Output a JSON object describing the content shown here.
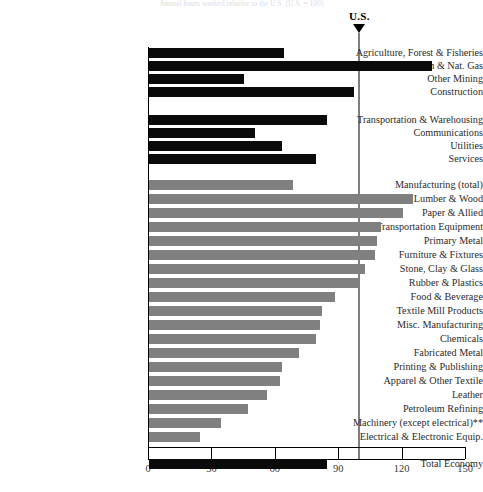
{
  "figure": {
    "title": "Annual hours worked relative to the U.S. (U.S. = 100)",
    "us_marker_label": "U.S.",
    "us_marker_value": 100
  },
  "chart_data": {
    "type": "bar",
    "orientation": "horizontal",
    "title": "Annual hours worked relative to the U.S. (U.S. = 100)",
    "xlabel": "",
    "ylabel": "",
    "xlim": [
      0,
      150
    ],
    "xticks": [
      0,
      30,
      60,
      90,
      120,
      150
    ],
    "xticklabels": [
      "0",
      "30",
      "60",
      "90",
      "120",
      "150"
    ],
    "grid": false,
    "legend": null,
    "reference_line": {
      "label": "U.S.",
      "value": 100
    },
    "series": [
      {
        "name": "Non-manufacturing sectors",
        "color": "#0a0a0a",
        "categories": [
          "Agriculture, Forest & Fisheries",
          "Crude Petroleum & Nat. Gas",
          "Other Mining",
          "Construction",
          "Transportation & Warehousing",
          "Communications",
          "Utilities",
          "Services",
          "Total Economy"
        ],
        "values": [
          64,
          134,
          45,
          97,
          84,
          50,
          63,
          79,
          84
        ]
      },
      {
        "name": "Manufacturing industries",
        "color": "#808080",
        "categories": [
          "Manufacturing (total)",
          "Lumber & Wood",
          "Paper & Allied",
          "Transportation Equipment",
          "Primary Metal",
          "Furniture & Fixtures",
          "Stone, Clay & Glass",
          "Rubber & Plastics",
          "Food & Beverage",
          "Textile Mill Products",
          "Misc. Manufacturing",
          "Chemicals",
          "Fabricated Metal",
          "Printing & Publishing",
          "Apparel & Other Textile",
          "Leather",
          "Petroleum Refining",
          "Machinery (except electrical)**",
          "Electrical & Electronic Equip."
        ],
        "values": [
          68,
          125,
          120,
          110,
          108,
          107,
          102,
          100,
          88,
          82,
          81,
          79,
          71,
          63,
          62,
          56,
          47,
          34,
          24
        ]
      }
    ]
  },
  "rows": [
    {
      "label": "Agriculture, Forest & Fisheries",
      "value": 64,
      "color": "dark",
      "y": 53
    },
    {
      "label": "Crude Petroleum & Nat. Gas",
      "value": 134,
      "color": "dark",
      "y": 66
    },
    {
      "label": "Other Mining",
      "value": 45,
      "color": "dark",
      "y": 79
    },
    {
      "label": "Construction",
      "value": 97,
      "color": "dark",
      "y": 92
    },
    {
      "label": "Transportation & Warehousing",
      "value": 84,
      "color": "dark",
      "y": 120
    },
    {
      "label": "Communications",
      "value": 50,
      "color": "dark",
      "y": 133
    },
    {
      "label": "Utilities",
      "value": 63,
      "color": "dark",
      "y": 146
    },
    {
      "label": "Services",
      "value": 79,
      "color": "dark",
      "y": 159
    },
    {
      "label": "Manufacturing (total)",
      "value": 68,
      "color": "gray",
      "y": 185
    },
    {
      "label": "Lumber & Wood",
      "value": 125,
      "color": "gray",
      "y": 199
    },
    {
      "label": "Paper & Allied",
      "value": 120,
      "color": "gray",
      "y": 213
    },
    {
      "label": "Transportation Equipment",
      "value": 110,
      "color": "gray",
      "y": 227
    },
    {
      "label": "Primary Metal",
      "value": 108,
      "color": "gray",
      "y": 241
    },
    {
      "label": "Furniture & Fixtures",
      "value": 107,
      "color": "gray",
      "y": 255
    },
    {
      "label": "Stone, Clay & Glass",
      "value": 102,
      "color": "gray",
      "y": 269
    },
    {
      "label": "Rubber & Plastics",
      "value": 100,
      "color": "gray",
      "y": 283
    },
    {
      "label": "Food & Beverage",
      "value": 88,
      "color": "gray",
      "y": 297
    },
    {
      "label": "Textile Mill Products",
      "value": 82,
      "color": "gray",
      "y": 311
    },
    {
      "label": "Misc. Manufacturing",
      "value": 81,
      "color": "gray",
      "y": 325
    },
    {
      "label": "Chemicals",
      "value": 79,
      "color": "gray",
      "y": 339
    },
    {
      "label": "Fabricated Metal",
      "value": 71,
      "color": "gray",
      "y": 353
    },
    {
      "label": "Printing & Publishing",
      "value": 63,
      "color": "gray",
      "y": 367
    },
    {
      "label": "Apparel & Other Textile",
      "value": 62,
      "color": "gray",
      "y": 381
    },
    {
      "label": "Leather",
      "value": 56,
      "color": "gray",
      "y": 395
    },
    {
      "label": "Petroleum Refining",
      "value": 47,
      "color": "gray",
      "y": 409
    },
    {
      "label": "Machinery (except electrical)**",
      "value": 34,
      "color": "gray",
      "y": 423
    },
    {
      "label": "Electrical & Electronic Equip.",
      "value": 24,
      "color": "gray",
      "y": 437
    },
    {
      "label": "Total Economy",
      "value": 84,
      "color": "dark",
      "y": 464
    }
  ],
  "axis": {
    "ticks": [
      {
        "label": "0",
        "value": 0
      },
      {
        "label": "30",
        "value": 30
      },
      {
        "label": "60",
        "value": 60
      },
      {
        "label": "90",
        "value": 90
      },
      {
        "label": "120",
        "value": 120
      },
      {
        "label": "150",
        "value": 150
      }
    ]
  }
}
